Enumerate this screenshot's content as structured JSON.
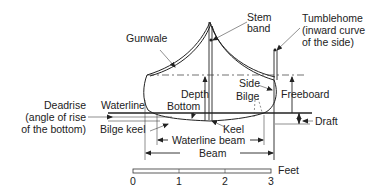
{
  "diagram": {
    "labels": {
      "gunwale": "Gunwale",
      "stem_band_1": "Stem",
      "stem_band_2": "band",
      "tumblehome_1": "Tumblehome",
      "tumblehome_2": "(inward curve",
      "tumblehome_3": "of the side)",
      "side": "Side",
      "bilge": "Bilge",
      "freeboard": "Freeboard",
      "depth": "Depth",
      "bottom": "Bottom",
      "deadrise_1": "Deadrise",
      "deadrise_2": "(angle of rise",
      "deadrise_3": "of the bottom)",
      "waterline": "Waterline",
      "bilge_keel": "Bilge keel",
      "keel": "Keel",
      "draft": "Draft",
      "waterline_beam": "Waterline beam",
      "beam": "Beam"
    },
    "scale": {
      "unit": "Feet",
      "ticks": [
        "0",
        "1",
        "2",
        "3"
      ]
    }
  }
}
